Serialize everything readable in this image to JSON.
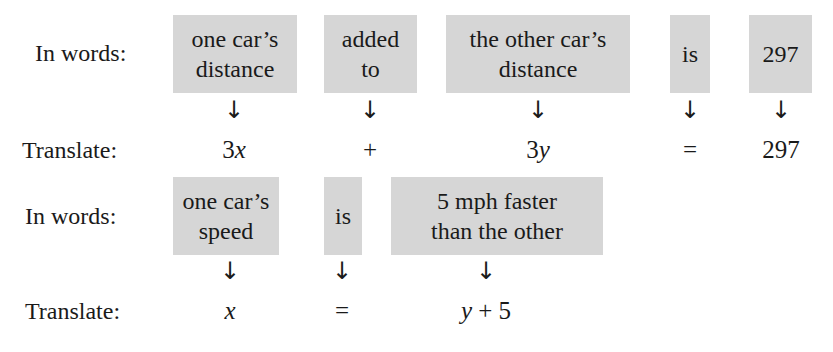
{
  "section1": {
    "words_label": "In words:",
    "translate_label": "Translate:",
    "phrases": [
      {
        "text": "one car’s\ndistance",
        "line1": "one car’s",
        "line2": "distance",
        "translation": "3x"
      },
      {
        "text": "added\nto",
        "line1": "added",
        "line2": "to",
        "translation": "+"
      },
      {
        "text": "the other car’s\ndistance",
        "line1": "the other car’s",
        "line2": "distance",
        "translation": "3y"
      },
      {
        "text": "is",
        "line1": "is",
        "line2": "",
        "translation": "="
      },
      {
        "text": "297",
        "line1": "297",
        "line2": "",
        "translation": "297"
      }
    ]
  },
  "section2": {
    "words_label": "In words:",
    "translate_label": "Translate:",
    "phrases": [
      {
        "line1": "one car’s",
        "line2": "speed",
        "translation": "x"
      },
      {
        "line1": "is",
        "line2": "",
        "translation": "="
      },
      {
        "line1": "5 mph faster",
        "line2": "than the other",
        "translation": "y + 5"
      }
    ]
  },
  "arrow_glyph": "↓",
  "colors": {
    "box": "#d6d6d6",
    "text": "#1a1a1a",
    "background": "#ffffff"
  }
}
